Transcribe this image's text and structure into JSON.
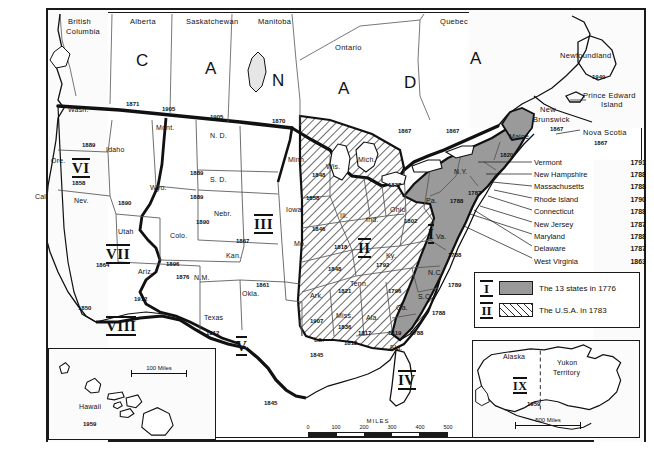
{
  "map": {
    "title": "Growth of the United States",
    "frame_color": "#1a1a1a",
    "region_i_color": "#9a9a9a",
    "canada_letters": [
      "C",
      "A",
      "N",
      "A",
      "D",
      "A"
    ]
  },
  "legend": {
    "items": [
      {
        "roman": "I",
        "label": "The 13 states in 1776",
        "style": "solid"
      },
      {
        "roman": "II",
        "label": "The U.S.A. in 1783",
        "style": "hatch"
      }
    ]
  },
  "callouts": {
    "heading_items": [
      {
        "name": "Newfoundland",
        "year": "1949"
      },
      {
        "name": "Prince Edward",
        "year": ""
      },
      {
        "name": "Island",
        "year": ""
      },
      {
        "name": "Nova Scotia",
        "year": "1867"
      }
    ],
    "states": [
      {
        "name": "Vermont",
        "year": "1791"
      },
      {
        "name": "New Hampshire",
        "year": "1788"
      },
      {
        "name": "Massachusetts",
        "year": "1788"
      },
      {
        "name": "Rhode Island",
        "year": "1790"
      },
      {
        "name": "Connecticut",
        "year": "1788"
      },
      {
        "name": "New Jersey",
        "year": "1787"
      },
      {
        "name": "Maryland",
        "year": "1788"
      },
      {
        "name": "Delaware",
        "year": "1787"
      },
      {
        "name": "West Virginia",
        "year": "1863"
      }
    ]
  },
  "provinces": [
    {
      "name": "British",
      "x": 68,
      "y": 18
    },
    {
      "name": "Columbia",
      "x": 66,
      "y": 28
    },
    {
      "name": "Alberta",
      "x": 130,
      "y": 18
    },
    {
      "name": "Saskatchewan",
      "x": 190,
      "y": 18
    },
    {
      "name": "Manitoba",
      "x": 258,
      "y": 18
    },
    {
      "name": "Ontario",
      "x": 335,
      "y": 44
    },
    {
      "name": "Quebec",
      "x": 440,
      "y": 18
    },
    {
      "name": "Newfoundland",
      "x": 588,
      "y": 56
    },
    {
      "name": "Prince Edward",
      "x": 590,
      "y": 92
    },
    {
      "name": "Island",
      "x": 601,
      "y": 101
    },
    {
      "name": "New",
      "x": 546,
      "y": 107
    },
    {
      "name": "Brunswick",
      "x": 538,
      "y": 116
    },
    {
      "name": "Nova Scotia",
      "x": 588,
      "y": 130
    }
  ],
  "canada_letters_pos": [
    {
      "ch": "C",
      "x": 136,
      "y": 62
    },
    {
      "ch": "A",
      "x": 205,
      "y": 70
    },
    {
      "ch": "N",
      "x": 272,
      "y": 82
    },
    {
      "ch": "A",
      "x": 338,
      "y": 90
    },
    {
      "ch": "D",
      "x": 404,
      "y": 84
    },
    {
      "ch": "A",
      "x": 470,
      "y": 58
    }
  ],
  "states": [
    {
      "name": "Wash.",
      "x": 68,
      "y": 110
    },
    {
      "name": "Ore.",
      "x": 58,
      "y": 160
    },
    {
      "name": "Idaho",
      "x": 110,
      "y": 147
    },
    {
      "name": "Mont.",
      "x": 158,
      "y": 122
    },
    {
      "name": "N. D.",
      "x": 212,
      "y": 131
    },
    {
      "name": "Minn.",
      "x": 290,
      "y": 154
    },
    {
      "name": "Wis.",
      "x": 328,
      "y": 162
    },
    {
      "name": "Mich.",
      "x": 362,
      "y": 158
    },
    {
      "name": "S. D.",
      "x": 212,
      "y": 174
    },
    {
      "name": "Wyo.",
      "x": 152,
      "y": 182
    },
    {
      "name": "Nev.",
      "x": 76,
      "y": 196
    },
    {
      "name": "Cal.",
      "x": 38,
      "y": 192
    },
    {
      "name": "Utah",
      "x": 120,
      "y": 226
    },
    {
      "name": "Colo.",
      "x": 172,
      "y": 230
    },
    {
      "name": "Nebr.",
      "x": 216,
      "y": 208
    },
    {
      "name": "Iowa.",
      "x": 288,
      "y": 204
    },
    {
      "name": "Ill.",
      "x": 342,
      "y": 210
    },
    {
      "name": "Ind.",
      "x": 368,
      "y": 214
    },
    {
      "name": "Ohio",
      "x": 392,
      "y": 205
    },
    {
      "name": "Mo.",
      "x": 296,
      "y": 238
    },
    {
      "name": "Kan.",
      "x": 228,
      "y": 250
    },
    {
      "name": "Ariz.",
      "x": 140,
      "y": 266
    },
    {
      "name": "N.M.",
      "x": 196,
      "y": 272
    },
    {
      "name": "Okla.",
      "x": 244,
      "y": 288
    },
    {
      "name": "Ark.",
      "x": 312,
      "y": 290
    },
    {
      "name": "Ky.",
      "x": 388,
      "y": 250
    },
    {
      "name": "Tenn.",
      "x": 352,
      "y": 278
    },
    {
      "name": "Texas",
      "x": 208,
      "y": 312
    },
    {
      "name": "Miss.",
      "x": 338,
      "y": 310
    },
    {
      "name": "Ala.",
      "x": 368,
      "y": 312
    },
    {
      "name": "Ga.",
      "x": 398,
      "y": 302
    },
    {
      "name": "La.",
      "x": 316,
      "y": 334
    },
    {
      "name": "Fla.",
      "x": 392,
      "y": 342
    },
    {
      "name": "Pa.",
      "x": 428,
      "y": 196
    },
    {
      "name": "Va.",
      "x": 438,
      "y": 232
    },
    {
      "name": "N.C.",
      "x": 430,
      "y": 268
    },
    {
      "name": "S.C.",
      "x": 420,
      "y": 292
    },
    {
      "name": "N.Y.",
      "x": 456,
      "y": 168
    },
    {
      "name": "Maine",
      "x": 516,
      "y": 132
    }
  ],
  "dates": [
    {
      "year": "1871",
      "x": 126,
      "y": 101
    },
    {
      "year": "1905",
      "x": 162,
      "y": 106
    },
    {
      "year": "1905",
      "x": 210,
      "y": 114
    },
    {
      "year": "1870",
      "x": 272,
      "y": 118
    },
    {
      "year": "1889",
      "x": 82,
      "y": 142
    },
    {
      "year": "1889",
      "x": 190,
      "y": 170
    },
    {
      "year": "1889",
      "x": 190,
      "y": 194
    },
    {
      "year": "1858",
      "x": 72,
      "y": 180
    },
    {
      "year": "1890",
      "x": 118,
      "y": 200
    },
    {
      "year": "1890",
      "x": 196,
      "y": 219
    },
    {
      "year": "1867",
      "x": 236,
      "y": 238
    },
    {
      "year": "1848",
      "x": 312,
      "y": 172
    },
    {
      "year": "1858",
      "x": 306,
      "y": 195
    },
    {
      "year": "1846",
      "x": 312,
      "y": 226
    },
    {
      "year": "1818",
      "x": 334,
      "y": 244
    },
    {
      "year": "1848",
      "x": 328,
      "y": 266
    },
    {
      "year": "1821",
      "x": 338,
      "y": 288
    },
    {
      "year": "1864",
      "x": 96,
      "y": 262
    },
    {
      "year": "1896",
      "x": 166,
      "y": 261
    },
    {
      "year": "1876",
      "x": 176,
      "y": 274
    },
    {
      "year": "1861",
      "x": 256,
      "y": 282
    },
    {
      "year": "1850",
      "x": 78,
      "y": 305
    },
    {
      "year": "1912",
      "x": 134,
      "y": 296
    },
    {
      "year": "1912",
      "x": 206,
      "y": 330
    },
    {
      "year": "1907",
      "x": 310,
      "y": 318
    },
    {
      "year": "1836",
      "x": 338,
      "y": 324
    },
    {
      "year": "1845",
      "x": 310,
      "y": 352
    },
    {
      "year": "1812",
      "x": 344,
      "y": 340
    },
    {
      "year": "1817",
      "x": 358,
      "y": 330
    },
    {
      "year": "1819",
      "x": 388,
      "y": 330
    },
    {
      "year": "1796",
      "x": 388,
      "y": 288
    },
    {
      "year": "1792",
      "x": 376,
      "y": 262
    },
    {
      "year": "1802",
      "x": 404,
      "y": 218
    },
    {
      "year": "1837",
      "x": 388,
      "y": 182
    },
    {
      "year": "1788",
      "x": 448,
      "y": 252
    },
    {
      "year": "1789",
      "x": 448,
      "y": 282
    },
    {
      "year": "1788",
      "x": 432,
      "y": 310
    },
    {
      "year": "1788",
      "x": 410,
      "y": 330
    },
    {
      "year": "1788",
      "x": 452,
      "y": 198
    },
    {
      "year": "1787",
      "x": 470,
      "y": 190
    },
    {
      "year": "1820",
      "x": 502,
      "y": 152
    },
    {
      "year": "1867",
      "x": 400,
      "y": 128
    },
    {
      "year": "1867",
      "x": 448,
      "y": 128
    },
    {
      "year": "1867",
      "x": 552,
      "y": 126
    },
    {
      "year": "1949",
      "x": 596,
      "y": 74
    },
    {
      "year": "1867",
      "x": 596,
      "y": 140
    },
    {
      "year": "1845",
      "x": 264,
      "y": 400
    }
  ],
  "romans": [
    {
      "num": "VI",
      "x": 72,
      "y": 160
    },
    {
      "num": "VII",
      "x": 108,
      "y": 246
    },
    {
      "num": "VIII",
      "x": 112,
      "y": 320
    },
    {
      "num": "III",
      "x": 256,
      "y": 216
    },
    {
      "num": "V",
      "x": 236,
      "y": 338
    },
    {
      "num": "II",
      "x": 360,
      "y": 240
    },
    {
      "num": "I",
      "x": 428,
      "y": 228
    },
    {
      "num": "IV",
      "x": 400,
      "y": 374
    }
  ],
  "scale_main": {
    "title": "MILES",
    "ticks": [
      "0",
      "100",
      "200",
      "300",
      "400",
      "500"
    ]
  },
  "inset_hawaii": {
    "name": "Hawaii",
    "year": "1959",
    "scale_label": "100 Miles"
  },
  "inset_alaska": {
    "name": "Alaska",
    "neighbor": "Yukon Territory",
    "roman": "IX",
    "year": "1959",
    "scale_label": "500 Miles"
  }
}
